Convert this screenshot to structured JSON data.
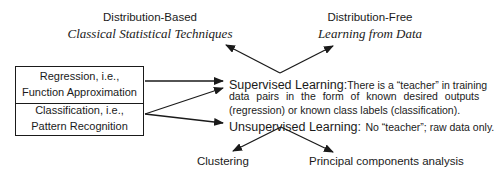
{
  "left_header": {
    "title": "Distribution-Based",
    "subtitle": "Classical Statistical Techniques"
  },
  "right_header": {
    "title": "Distribution-Free",
    "subtitle": "Learning from Data"
  },
  "problem_box": {
    "regression": [
      "Regression, i.e.,",
      "Function Approximation"
    ],
    "classification": [
      "Classification, i.e.,",
      "Pattern Recognition"
    ]
  },
  "supervised": {
    "lead": "Supervised Learning:",
    "line1": "There is a “teacher” in training",
    "line2": "data pairs in the form of known desired outputs",
    "line3": "(regression) or known class labels (classification)."
  },
  "unsupervised": {
    "lead": "Unsupervised Learning:",
    "text": "No “teacher”; raw data only."
  },
  "unsupervised_methods": {
    "left": "Clustering",
    "right": "Principal components analysis"
  }
}
